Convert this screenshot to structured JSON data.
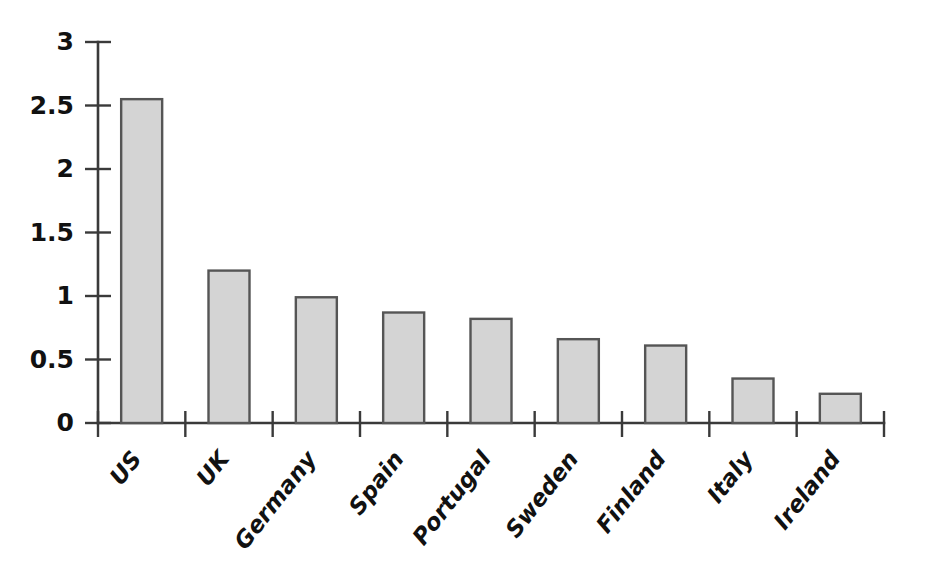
{
  "chart_data": {
    "type": "bar",
    "title": "",
    "subtitle": "",
    "xlabel": "",
    "ylabel": "",
    "categories": [
      "US",
      "UK",
      "Germany",
      "Spain",
      "Portugal",
      "Sweden",
      "Finland",
      "Italy",
      "Ireland"
    ],
    "values": [
      2.55,
      1.2,
      0.99,
      0.87,
      0.82,
      0.66,
      0.61,
      0.35,
      0.23
    ],
    "ylim": [
      0,
      3
    ],
    "ytick_labels": [
      "0",
      "0.5",
      "1",
      "1.5",
      "2",
      "2.5",
      "3"
    ],
    "ytick_values": [
      0,
      0.5,
      1,
      1.5,
      2,
      2.5,
      3
    ],
    "grid": false,
    "legend": null,
    "legend_position": "none",
    "annotations": [],
    "series": [
      {
        "name": "",
        "values": [
          2.55,
          1.2,
          0.99,
          0.87,
          0.82,
          0.66,
          0.61,
          0.35,
          0.23
        ]
      }
    ],
    "style": {
      "bar_fill": "#d4d4d4",
      "bar_stroke": "#555555",
      "axis_color": "#3a3a3a",
      "text_color": "#111111",
      "background": "#ffffff",
      "xtick_label_rotation_deg": -52
    }
  }
}
